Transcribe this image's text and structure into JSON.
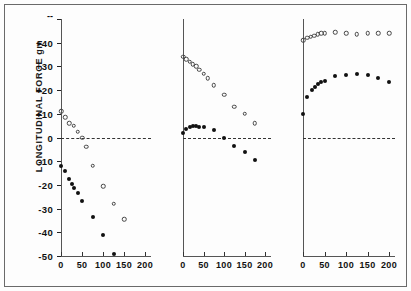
{
  "figure": {
    "y_axis": {
      "label": "LONGITUDINAL FORCE  gm",
      "ticks": [
        {
          "value": 50,
          "label": ""
        },
        {
          "value": 40,
          "label": "+40"
        },
        {
          "value": 30,
          "label": "+30"
        },
        {
          "value": 20,
          "label": "+20"
        },
        {
          "value": 10,
          "label": "+10"
        },
        {
          "value": 0,
          "label": "0"
        },
        {
          "value": -10,
          "label": "-10"
        },
        {
          "value": -20,
          "label": "-20"
        },
        {
          "value": -30,
          "label": "-30"
        },
        {
          "value": -40,
          "label": "-40"
        },
        {
          "value": -50,
          "label": "-50"
        }
      ],
      "range": [
        -50,
        50
      ]
    },
    "x_axis": {
      "ticks": [
        "0",
        "50",
        "100",
        "150",
        "200"
      ],
      "range": [
        0,
        200
      ]
    },
    "zero_reference_line": "dashed"
  },
  "chart_data": [
    {
      "type": "scatter",
      "title": "",
      "panel": 1,
      "xlabel": "",
      "ylabel": "LONGITUDINAL FORCE  gm",
      "xlim": [
        0,
        200
      ],
      "ylim": [
        -50,
        50
      ],
      "grid": false,
      "legend": "none",
      "series": [
        {
          "name": "open-circles",
          "marker": "open",
          "x": [
            0,
            10,
            20,
            30,
            40,
            50,
            60,
            75,
            100,
            125,
            150
          ],
          "y": [
            11,
            8.5,
            6,
            5,
            2.5,
            0,
            -4,
            -12,
            -20.5,
            -28,
            -34.5
          ]
        },
        {
          "name": "filled-circles",
          "marker": "filled",
          "x": [
            0,
            10,
            20,
            25,
            30,
            40,
            50,
            75,
            100,
            125
          ],
          "y": [
            -12,
            -14,
            -17.5,
            -19.5,
            -21.5,
            -23.5,
            -27,
            -33.5,
            -41,
            -49
          ]
        }
      ]
    },
    {
      "type": "scatter",
      "title": "",
      "panel": 2,
      "xlabel": "",
      "ylabel": "",
      "xlim": [
        0,
        200
      ],
      "ylim": [
        -50,
        50
      ],
      "grid": false,
      "legend": "none",
      "series": [
        {
          "name": "open-circles",
          "marker": "open",
          "x": [
            0,
            8,
            16,
            24,
            32,
            40,
            50,
            60,
            75,
            100,
            125,
            150,
            175
          ],
          "y": [
            34,
            33,
            32,
            31,
            30,
            28.5,
            27,
            25,
            22,
            18,
            13,
            10,
            6
          ]
        },
        {
          "name": "filled-circles",
          "marker": "filled",
          "x": [
            0,
            8,
            16,
            24,
            32,
            40,
            50,
            75,
            100,
            125,
            150,
            175
          ],
          "y": [
            2,
            3.5,
            4.5,
            5,
            5,
            4.5,
            4.5,
            3,
            0,
            -3.5,
            -6,
            -9.5
          ]
        }
      ]
    },
    {
      "type": "scatter",
      "title": "",
      "panel": 3,
      "xlabel": "",
      "ylabel": "",
      "xlim": [
        0,
        200
      ],
      "ylim": [
        -50,
        50
      ],
      "grid": false,
      "legend": "none",
      "series": [
        {
          "name": "open-circles",
          "marker": "open",
          "x": [
            0,
            10,
            18,
            26,
            34,
            42,
            50,
            75,
            100,
            125,
            150,
            175,
            200
          ],
          "y": [
            41,
            42,
            42.5,
            43,
            43.5,
            44,
            44,
            44.5,
            44,
            43.5,
            44,
            44,
            44
          ]
        },
        {
          "name": "filled-circles",
          "marker": "filled",
          "x": [
            0,
            10,
            20,
            28,
            35,
            42,
            50,
            75,
            100,
            125,
            150,
            175,
            200
          ],
          "y": [
            10,
            17,
            20,
            21.5,
            22.5,
            23.5,
            24,
            26,
            26.5,
            27,
            26.5,
            25,
            23.5
          ]
        }
      ]
    }
  ]
}
